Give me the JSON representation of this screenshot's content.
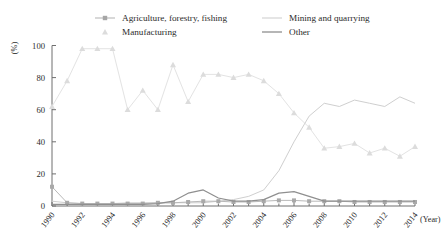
{
  "chart_data": {
    "type": "line",
    "title": "",
    "xlabel": "(Year)",
    "ylabel": "(%)",
    "ylim": [
      0,
      100
    ],
    "yticks": [
      0,
      20,
      40,
      60,
      80,
      100
    ],
    "xlim": [
      1990,
      2014
    ],
    "xticks": [
      1990,
      1992,
      1994,
      1996,
      1998,
      2000,
      2002,
      2004,
      2006,
      2008,
      2010,
      2012,
      2014
    ],
    "x": [
      1990,
      1991,
      1992,
      1993,
      1994,
      1995,
      1996,
      1997,
      1998,
      1999,
      2000,
      2001,
      2002,
      2003,
      2004,
      2005,
      2006,
      2007,
      2008,
      2009,
      2010,
      2011,
      2012,
      2013,
      2014
    ],
    "grid": false,
    "legend_position": "top",
    "series": [
      {
        "name": "Agriculture, forestry, fishing",
        "marker": "square",
        "color": "#b9b9b9",
        "values": [
          12,
          2,
          1.5,
          1.5,
          1.5,
          1.5,
          1.5,
          2,
          2,
          2.5,
          3,
          3,
          2.5,
          2.5,
          3,
          3.5,
          3.5,
          3,
          3,
          3,
          2.5,
          2.5,
          2.5,
          2.5,
          2.5
        ]
      },
      {
        "name": "Mining and quarrying",
        "marker": "none",
        "color": "#cfcfcf",
        "values": [
          3,
          2,
          1.5,
          1.5,
          1.5,
          2,
          2,
          2,
          2,
          2,
          2,
          3,
          4,
          6,
          10,
          22,
          40,
          56,
          64,
          62,
          66,
          64,
          62,
          68,
          64
        ]
      },
      {
        "name": "Manufacturing",
        "marker": "triangle",
        "color": "#e3e3e3",
        "values": [
          62,
          78,
          98,
          98,
          98,
          60,
          72,
          60,
          88,
          65,
          82,
          82,
          80,
          82,
          78,
          70,
          58,
          49,
          36,
          37,
          39,
          33,
          36,
          31,
          37
        ]
      },
      {
        "name": "Other",
        "marker": "none",
        "color": "#8f8f8f",
        "values": [
          1,
          1,
          1,
          1,
          1,
          1,
          1,
          1.5,
          3,
          8,
          10,
          5,
          3,
          3,
          4,
          8,
          9,
          6,
          3,
          3,
          3,
          3,
          3,
          3,
          3
        ]
      }
    ]
  },
  "legend": {
    "items": [
      {
        "label": "Agriculture, forestry, fishing",
        "marker": "square",
        "color": "#b9b9b9"
      },
      {
        "label": "Mining and quarrying",
        "marker": "line-light",
        "color": "#cfcfcf"
      },
      {
        "label": "Manufacturing",
        "marker": "triangle",
        "color": "#e3e3e3"
      },
      {
        "label": "Other",
        "marker": "line-dark",
        "color": "#8f8f8f"
      }
    ]
  },
  "axes": {
    "y_title": "(%)",
    "x_title": "(Year)",
    "y_tick_labels": [
      "0",
      "20",
      "40",
      "60",
      "80",
      "100"
    ],
    "x_tick_labels": [
      "1990",
      "1992",
      "1994",
      "1996",
      "1998",
      "2000",
      "2002",
      "2004",
      "2006",
      "2008",
      "2010",
      "2012",
      "2014"
    ]
  }
}
